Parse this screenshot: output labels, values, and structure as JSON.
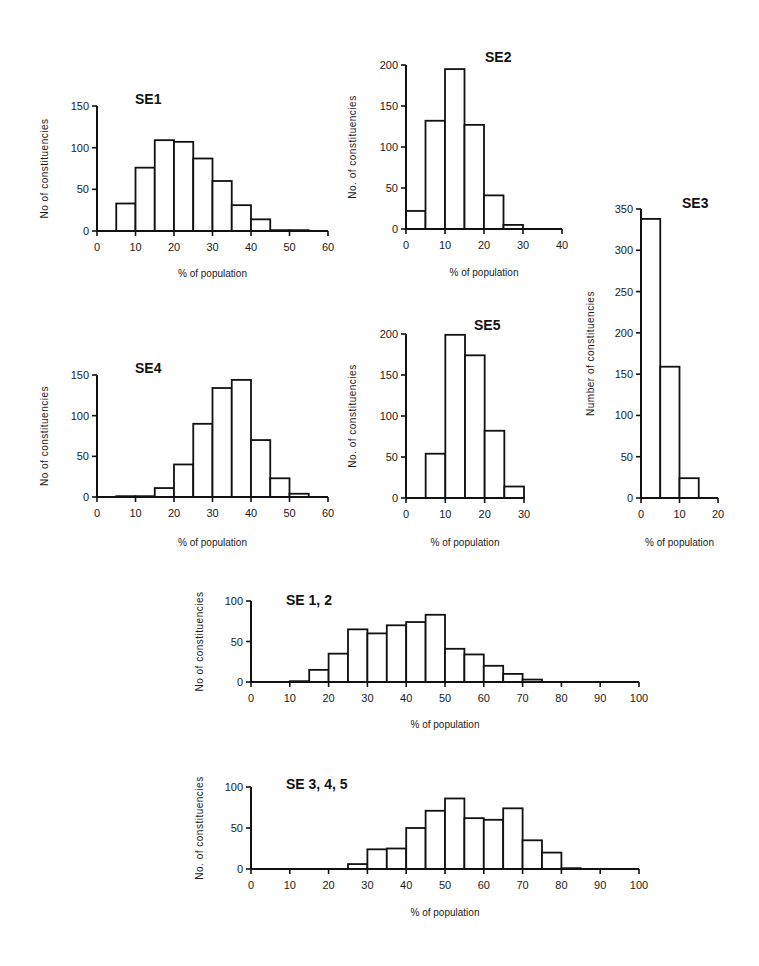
{
  "chart_data": [
    {
      "id": "se1",
      "type": "bar",
      "title": "SE1",
      "xlabel": "% of population",
      "ylabel": "No  of constituencies",
      "bin_width": 5,
      "categories": [
        "0-5",
        "5-10",
        "10-15",
        "15-20",
        "20-25",
        "25-30",
        "30-35",
        "35-40",
        "40-45",
        "45-50",
        "50-55",
        "55-60"
      ],
      "values": [
        0,
        33,
        76,
        109,
        107,
        87,
        60,
        31,
        14,
        1,
        1,
        0
      ],
      "xlim": [
        0,
        60
      ],
      "ylim": [
        0,
        150
      ],
      "xticks": [
        0,
        10,
        20,
        30,
        40,
        50,
        60
      ],
      "yticks": [
        0,
        50,
        100,
        150
      ],
      "layout": {
        "x0": 97,
        "x1": 328,
        "y0": 231,
        "y1": 106,
        "title_x": 135,
        "title_y": 104,
        "ylabel_x": 48,
        "xlabel_y": 277
      }
    },
    {
      "id": "se2",
      "type": "bar",
      "title": "SE2",
      "xlabel": "% of population",
      "ylabel": "No. of constituencies",
      "bin_width": 5,
      "categories": [
        "0-5",
        "5-10",
        "10-15",
        "15-20",
        "20-25",
        "25-30",
        "30-35",
        "35-40"
      ],
      "values": [
        22,
        132,
        195,
        127,
        41,
        5,
        0,
        0
      ],
      "xlim": [
        0,
        40
      ],
      "ylim": [
        0,
        200
      ],
      "xticks": [
        0,
        10,
        20,
        30,
        40
      ],
      "yticks": [
        0,
        50,
        100,
        150,
        200
      ],
      "layout": {
        "x0": 406,
        "x1": 562,
        "y0": 229,
        "y1": 65,
        "title_x": 485,
        "title_y": 62,
        "ylabel_x": 356,
        "xlabel_y": 276
      }
    },
    {
      "id": "se3",
      "type": "bar",
      "title": "SE3",
      "xlabel": "% of population",
      "ylabel": "Number of constituencies",
      "bin_width": 5,
      "categories": [
        "0-5",
        "5-10",
        "10-15",
        "15-20"
      ],
      "values": [
        338,
        159,
        24,
        0
      ],
      "xlim": [
        0,
        20
      ],
      "ylim": [
        0,
        350
      ],
      "xticks": [
        0,
        10,
        20
      ],
      "yticks": [
        0,
        50,
        100,
        150,
        200,
        250,
        300,
        350
      ],
      "layout": {
        "x0": 641,
        "x1": 718,
        "y0": 498,
        "y1": 209,
        "title_x": 682,
        "title_y": 208,
        "ylabel_x": 594,
        "xlabel_y": 546
      }
    },
    {
      "id": "se4",
      "type": "bar",
      "title": "SE4",
      "xlabel": "% of population",
      "ylabel": "No  of constituencies",
      "bin_width": 5,
      "categories": [
        "0-5",
        "5-10",
        "10-15",
        "15-20",
        "20-25",
        "25-30",
        "30-35",
        "35-40",
        "40-45",
        "45-50",
        "50-55",
        "55-60"
      ],
      "values": [
        0,
        1,
        1,
        11,
        40,
        90,
        134,
        144,
        70,
        23,
        4,
        0
      ],
      "xlim": [
        0,
        60
      ],
      "ylim": [
        0,
        150
      ],
      "xticks": [
        0,
        10,
        20,
        30,
        40,
        50,
        60
      ],
      "yticks": [
        0,
        50,
        100,
        150
      ],
      "layout": {
        "x0": 97,
        "x1": 328,
        "y0": 497,
        "y1": 375,
        "title_x": 135,
        "title_y": 373,
        "ylabel_x": 48,
        "xlabel_y": 546
      }
    },
    {
      "id": "se5",
      "type": "bar",
      "title": "SE5",
      "xlabel": "% of population",
      "ylabel": "No. of constituencies",
      "bin_width": 5,
      "categories": [
        "0-5",
        "5-10",
        "10-15",
        "15-20",
        "20-25",
        "25-30"
      ],
      "values": [
        0,
        54,
        199,
        174,
        82,
        14
      ],
      "xlim": [
        0,
        30
      ],
      "ylim": [
        0,
        200
      ],
      "xticks": [
        0,
        10,
        20,
        30
      ],
      "yticks": [
        0,
        50,
        100,
        150,
        200
      ],
      "layout": {
        "x0": 406,
        "x1": 524,
        "y0": 498,
        "y1": 334,
        "title_x": 474,
        "title_y": 330,
        "ylabel_x": 356,
        "xlabel_y": 546
      }
    },
    {
      "id": "se12",
      "type": "bar",
      "title": "SE 1, 2",
      "xlabel": "% of population",
      "ylabel": "No  of constituencies",
      "bin_width": 5,
      "categories": [
        "0-5",
        "5-10",
        "10-15",
        "15-20",
        "20-25",
        "25-30",
        "30-35",
        "35-40",
        "40-45",
        "45-50",
        "50-55",
        "55-60",
        "60-65",
        "65-70",
        "70-75",
        "75-80",
        "80-85",
        "85-90",
        "90-95",
        "95-100"
      ],
      "values": [
        0,
        0,
        1,
        15,
        35,
        65,
        60,
        70,
        74,
        83,
        41,
        34,
        20,
        10,
        3,
        0,
        0,
        0,
        0,
        0
      ],
      "xlim": [
        0,
        100
      ],
      "ylim": [
        0,
        100
      ],
      "xticks": [
        0,
        10,
        20,
        30,
        40,
        50,
        60,
        70,
        80,
        90,
        100
      ],
      "yticks": [
        0,
        50,
        100
      ],
      "layout": {
        "x0": 251,
        "x1": 639,
        "y0": 682,
        "y1": 601,
        "title_x": 286,
        "title_y": 605,
        "ylabel_x": 203,
        "xlabel_y": 728
      }
    },
    {
      "id": "se345",
      "type": "bar",
      "title": "SE 3, 4, 5",
      "xlabel": "% of population",
      "ylabel": "No. of constituencies",
      "bin_width": 5,
      "categories": [
        "0-5",
        "5-10",
        "10-15",
        "15-20",
        "20-25",
        "25-30",
        "30-35",
        "35-40",
        "40-45",
        "45-50",
        "50-55",
        "55-60",
        "60-65",
        "65-70",
        "70-75",
        "75-80",
        "80-85",
        "85-90",
        "90-95",
        "95-100"
      ],
      "values": [
        0,
        0,
        0,
        0,
        0,
        6,
        24,
        25,
        50,
        71,
        86,
        62,
        60,
        74,
        35,
        20,
        1,
        0,
        0,
        0
      ],
      "xlim": [
        0,
        100
      ],
      "ylim": [
        0,
        100
      ],
      "xticks": [
        0,
        10,
        20,
        30,
        40,
        50,
        60,
        70,
        80,
        90,
        100
      ],
      "yticks": [
        0,
        50,
        100
      ],
      "layout": {
        "x0": 251,
        "x1": 639,
        "y0": 869,
        "y1": 787,
        "title_x": 286,
        "title_y": 789,
        "ylabel_x": 203,
        "xlabel_y": 916
      }
    }
  ]
}
